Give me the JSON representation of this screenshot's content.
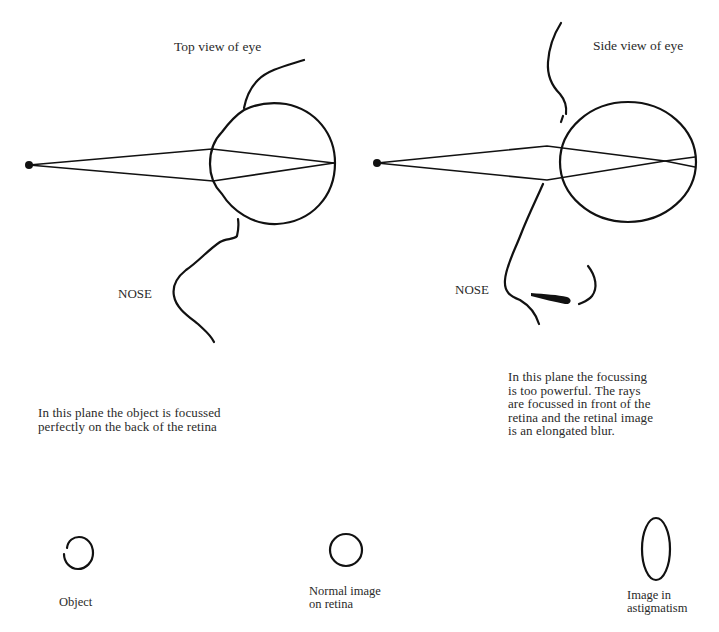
{
  "diagram": {
    "panels": [
      {
        "id": "top-view",
        "title": "Top view of eye",
        "nose_label": "NOSE",
        "description": "In this plane the object is focussed\nperfectly on the back of the retina",
        "focus": "on retina"
      },
      {
        "id": "side-view",
        "title": "Side view of eye",
        "nose_label": "NOSE",
        "description": "In this plane the focussing\nis too powerful. The rays\nare focussed in front of the\nretina and the retinal image\nis an elongated blur.",
        "focus": "in front of retina"
      }
    ],
    "legend": [
      {
        "shape": "circle",
        "label": "Object"
      },
      {
        "shape": "circle",
        "label": "Normal image\non retina"
      },
      {
        "shape": "ellipse",
        "label": "Image in\nastigmatism"
      }
    ],
    "colors": {
      "ink": "#111111",
      "text": "#2a2a2a",
      "background": "#ffffff"
    }
  }
}
